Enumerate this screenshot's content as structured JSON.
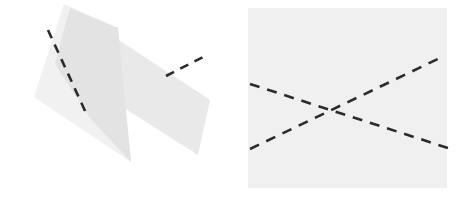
{
  "canvas": {
    "width": 461,
    "height": 203,
    "background_color": "#ffffff",
    "title": "Two geometric figure panels with dashed crossing lines"
  },
  "palette": {
    "background": "#ffffff",
    "shape_light_gray": "#f0f0f0",
    "shape_mid_gray": "#e8e8e8",
    "shape_overlap_gray": "#e2e2e2",
    "dashed_line_color": "#2b2b2b"
  },
  "panels": [
    {
      "id": "left-panel",
      "name": "rotated-overlapping-quadrilaterals",
      "bounds": {
        "x": 0,
        "y": 0,
        "width": 230,
        "height": 203
      },
      "shapes": [
        {
          "id": "left-backdrop-polygon",
          "name": "light-gray-backdrop-polygon",
          "type": "polygon",
          "fill": "#f1f1f1",
          "points": "64,4 118,28 131,162 34,97"
        },
        {
          "id": "left-rotated-rect",
          "name": "rotated-gray-rectangle",
          "type": "polygon",
          "fill": "#e9e9e9",
          "points": "70,8 210,100 198,155 55,64"
        },
        {
          "id": "left-overlap-region",
          "name": "overlap-shading-region",
          "type": "polygon",
          "fill": "#e3e3e3",
          "points": "70,8 118,28 131,162 90,118 55,64"
        }
      ],
      "dashed_lines": [
        {
          "id": "left-dash-major",
          "name": "dashed-line-major-diagonal",
          "x1": 48,
          "y1": 30,
          "x2": 86,
          "y2": 113,
          "stroke": "#2b2b2b",
          "stroke_width": 2.6,
          "dash_pattern": "9 7"
        },
        {
          "id": "left-dash-minor",
          "name": "dashed-line-minor-diagonal",
          "x1": 166,
          "y1": 76,
          "x2": 207,
          "y2": 55,
          "stroke": "#2b2b2b",
          "stroke_width": 2.6,
          "dash_pattern": "9 7"
        }
      ]
    },
    {
      "id": "right-panel",
      "name": "rectangle-with-crossing-dashed-lines",
      "bounds": {
        "x": 230,
        "y": 0,
        "width": 231,
        "height": 203
      },
      "shapes": [
        {
          "id": "right-rect",
          "name": "axis-aligned-gray-rectangle",
          "type": "rect",
          "fill": "#f0f0f0",
          "x": 248,
          "y": 8,
          "width": 199,
          "height": 180
        }
      ],
      "dashed_lines": [
        {
          "id": "right-dash-descending",
          "name": "dashed-line-descending",
          "x1": 250,
          "y1": 84,
          "x2": 448,
          "y2": 148,
          "stroke": "#2b2b2b",
          "stroke_width": 2.6,
          "dash_pattern": "10 8"
        },
        {
          "id": "right-dash-ascending",
          "name": "dashed-line-ascending",
          "x1": 250,
          "y1": 149,
          "x2": 442,
          "y2": 57,
          "stroke": "#2b2b2b",
          "stroke_width": 2.6,
          "dash_pattern": "10 8"
        }
      ],
      "intersection": {
        "name": "lines-crossing-point",
        "x": 336,
        "y": 108
      }
    }
  ]
}
